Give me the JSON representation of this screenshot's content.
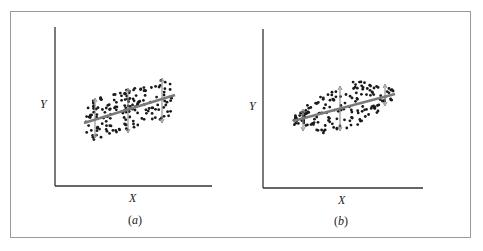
{
  "figure": {
    "panels": [
      {
        "id": "a",
        "caption_open": "(",
        "caption_letter": "a",
        "caption_close": ")",
        "x_label": "X",
        "y_label": "Y",
        "description": "Scatter with regression line; vertical spread of Y is constant across X (homoscedastic)",
        "regression_line": {
          "x1": 84,
          "y1": 123,
          "x2": 175,
          "y2": 95
        },
        "spread_arrows": [
          {
            "x": 95,
            "top": 98,
            "bottom": 138
          },
          {
            "x": 128,
            "top": 88,
            "bottom": 133
          },
          {
            "x": 162,
            "top": 78,
            "bottom": 123
          }
        ],
        "cloud": {
          "x0": 86,
          "x1": 174,
          "top_at_x0": 98,
          "top_at_x1": 78,
          "height": 40
        }
      },
      {
        "id": "b",
        "caption_open": "(",
        "caption_letter": "b",
        "caption_close": ")",
        "x_label": "X",
        "y_label": "Y",
        "description": "Scatter with regression line; vertical spread of Y varies with X (heteroscedastic, wider in middle)",
        "regression_line": {
          "x1": 293,
          "y1": 121,
          "x2": 395,
          "y2": 94
        },
        "spread_arrows": [
          {
            "x": 303,
            "top": 109,
            "bottom": 131
          },
          {
            "x": 340,
            "top": 86,
            "bottom": 131
          },
          {
            "x": 385,
            "top": 84,
            "bottom": 106
          }
        ],
        "cloud": {
          "x0": 294,
          "x1": 394
        }
      }
    ],
    "colors": {
      "frame": "#9a9a9a",
      "axis": "#333333",
      "dots": "#1a1a1a",
      "line": "#7a7a7a",
      "arrow": "#8a8a8a"
    }
  }
}
